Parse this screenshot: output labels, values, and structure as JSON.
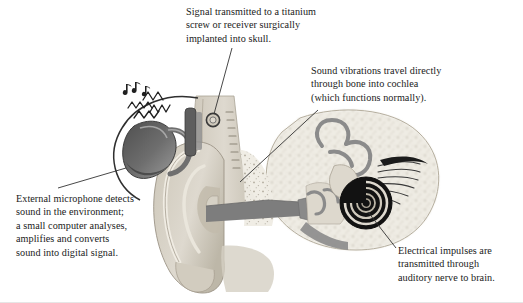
{
  "figure": {
    "background_color": "#ffffff",
    "text_color": "#1a1a1a"
  },
  "callouts": [
    {
      "id": "implant",
      "text": "Signal transmitted to a titanium\nscrew or receiver surgically\nimplanted into skull.",
      "leader_target": "titanium-screw-implant"
    },
    {
      "id": "bone",
      "text": "Sound vibrations travel directly\nthrough bone into cochlea\n(which functions normally).",
      "leader_target": "temporal-bone"
    },
    {
      "id": "microphone",
      "text": "External microphone detects\nsound in the environment;\na small computer analyses,\namplifies and converts\nsound into digital signal.",
      "leader_target": "external-sound-processor"
    },
    {
      "id": "nerve",
      "text": "Electrical impulses are\ntransmitted through\nauditory nerve to brain.",
      "leader_target": "cochlea"
    }
  ],
  "anatomy": {
    "parts": [
      "scalp-outline",
      "sound-waves",
      "external-sound-processor",
      "titanium-screw-implant",
      "skull-bone",
      "pinna",
      "ear-canal",
      "middle-ear-ossicles",
      "semicircular-canals",
      "cochlea",
      "auditory-nerve",
      "eustachian-tube"
    ]
  },
  "colors": {
    "skin_light": "#ded9cf",
    "skin_mid": "#c9c3b6",
    "cartilage": "#b9b3a6",
    "canal_dark": "#7d7d7d",
    "bone_speckle": "#efece4",
    "device_dark": "#5a5a5a",
    "device_mid": "#8c8c8c",
    "outline": "#3a3a3a",
    "cochlea_black": "#151515",
    "leader_line": "#333333"
  }
}
